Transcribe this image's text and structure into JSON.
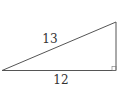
{
  "diagram": {
    "type": "right-triangle",
    "labels": {
      "hypotenuse": "13",
      "base": "12"
    },
    "right_angle_marker": true,
    "stroke_color": "#555555",
    "label_color": "#333333"
  }
}
